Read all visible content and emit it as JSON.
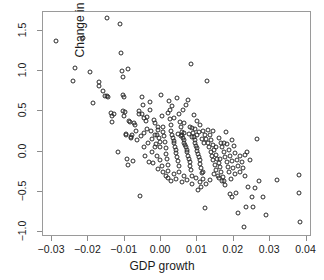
{
  "chart_data": {
    "type": "scatter",
    "title": "",
    "xlabel": "GDP growth",
    "ylabel": "Change in rate",
    "xlim": [
      -0.0325,
      0.0415
    ],
    "ylim": [
      -1.06,
      1.73
    ],
    "xticks": [
      -0.03,
      -0.02,
      -0.01,
      0.0,
      0.01,
      0.02,
      0.03,
      0.04
    ],
    "xticklabels": [
      "-0.03",
      "-0.02",
      "-0.01",
      "0.00",
      "0.01",
      "0.02",
      "0.03",
      "0.04"
    ],
    "yticks": [
      1.5,
      1.0,
      0.5,
      0.0,
      -0.5,
      -1.0
    ],
    "yticklabels": [
      "1.5",
      "1.0",
      "0.5",
      "0.0",
      "-0.5",
      "-1.0"
    ],
    "grid": false,
    "legend": null,
    "marker": "open-circle",
    "marker_color": "#2a2a2a",
    "frame_color": "#9a9a9a",
    "background": "#ffffff",
    "points": [
      [
        -0.029,
        1.37
      ],
      [
        -0.0243,
        0.88
      ],
      [
        -0.0237,
        1.04
      ],
      [
        -0.0216,
        1.41
      ],
      [
        -0.0197,
        0.98
      ],
      [
        -0.0188,
        0.6
      ],
      [
        -0.017,
        0.86
      ],
      [
        -0.017,
        0.81
      ],
      [
        -0.016,
        0.75
      ],
      [
        -0.0155,
        0.69
      ],
      [
        -0.015,
        0.69
      ],
      [
        -0.0148,
        1.66
      ],
      [
        -0.0146,
        0.68
      ],
      [
        -0.0138,
        0.48
      ],
      [
        -0.0136,
        0.44
      ],
      [
        -0.0134,
        0.37
      ],
      [
        -0.013,
        0.46
      ],
      [
        -0.0118,
        0.0
      ],
      [
        -0.0112,
        1.58
      ],
      [
        -0.011,
        1.22
      ],
      [
        -0.0108,
        1.0
      ],
      [
        -0.0106,
        0.93
      ],
      [
        -0.0104,
        0.5
      ],
      [
        -0.0102,
        0.44
      ],
      [
        -0.01,
        0.49
      ],
      [
        -0.0098,
        0.22
      ],
      [
        -0.0096,
        0.21
      ],
      [
        -0.0094,
        -0.09
      ],
      [
        -0.0092,
        -0.17
      ],
      [
        -0.009,
        1.02
      ],
      [
        -0.0088,
        0.38
      ],
      [
        -0.0086,
        0.36
      ],
      [
        -0.0084,
        0.18
      ],
      [
        -0.0082,
        0.17
      ],
      [
        -0.008,
        0.2
      ],
      [
        -0.0078,
        -0.12
      ],
      [
        -0.0074,
        0.35
      ],
      [
        -0.0072,
        0.33
      ],
      [
        -0.007,
        0.25
      ],
      [
        -0.0066,
        0.14
      ],
      [
        -0.0062,
        0.46
      ],
      [
        -0.0058,
        -0.55
      ],
      [
        -0.0056,
        0.19
      ],
      [
        -0.0052,
        0.68
      ],
      [
        -0.005,
        0.58
      ],
      [
        -0.0048,
        0.23
      ],
      [
        -0.0046,
        0.05
      ],
      [
        -0.0044,
        -0.05
      ],
      [
        -0.004,
        0.43
      ],
      [
        -0.0038,
        0.28
      ],
      [
        -0.0036,
        0.1
      ],
      [
        -0.0034,
        -0.13
      ],
      [
        -0.0032,
        0.61
      ],
      [
        -0.003,
        0.52
      ],
      [
        -0.0028,
        0.26
      ],
      [
        -0.0026,
        0.16
      ],
      [
        -0.0024,
        0.0
      ],
      [
        -0.0022,
        -0.14
      ],
      [
        -0.002,
        0.39
      ],
      [
        -0.0018,
        0.35
      ],
      [
        -0.0016,
        0.21
      ],
      [
        -0.0014,
        0.09
      ],
      [
        -0.0012,
        -0.06
      ],
      [
        -0.001,
        -0.22
      ],
      [
        -0.0008,
        0.27
      ],
      [
        -0.0006,
        0.17
      ],
      [
        -0.0004,
        0.05
      ],
      [
        -0.0002,
        -0.11
      ],
      [
        0.0,
        0.7
      ],
      [
        0.0002,
        0.44
      ],
      [
        0.0004,
        0.31
      ],
      [
        0.0006,
        0.24
      ],
      [
        0.0008,
        0.19
      ],
      [
        0.001,
        0.12
      ],
      [
        0.0012,
        0.04
      ],
      [
        0.0014,
        -0.03
      ],
      [
        0.0016,
        -0.09
      ],
      [
        0.0018,
        -0.17
      ],
      [
        0.002,
        -0.24
      ],
      [
        0.0022,
        0.63
      ],
      [
        0.0024,
        0.4
      ],
      [
        0.0026,
        0.33
      ],
      [
        0.0028,
        0.25
      ],
      [
        0.003,
        0.21
      ],
      [
        0.0032,
        0.17
      ],
      [
        0.0034,
        0.13
      ],
      [
        0.0036,
        0.1
      ],
      [
        0.0038,
        0.06
      ],
      [
        0.004,
        0.02
      ],
      [
        0.0042,
        -0.02
      ],
      [
        0.0044,
        -0.07
      ],
      [
        0.0046,
        -0.12
      ],
      [
        0.0048,
        -0.18
      ],
      [
        0.005,
        -0.26
      ],
      [
        0.0052,
        0.36
      ],
      [
        0.0054,
        0.3
      ],
      [
        0.0056,
        0.24
      ],
      [
        0.0058,
        0.2
      ],
      [
        0.006,
        0.17
      ],
      [
        0.0062,
        0.14
      ],
      [
        0.0064,
        0.11
      ],
      [
        0.0066,
        0.08
      ],
      [
        0.0068,
        0.05
      ],
      [
        0.007,
        0.02
      ],
      [
        0.0072,
        -0.01
      ],
      [
        0.0074,
        -0.05
      ],
      [
        0.0076,
        -0.09
      ],
      [
        0.0078,
        -0.13
      ],
      [
        0.008,
        -0.18
      ],
      [
        0.0082,
        -0.23
      ],
      [
        0.0084,
        -0.3
      ],
      [
        0.0086,
        0.29
      ],
      [
        0.0088,
        0.23
      ],
      [
        0.009,
        0.18
      ],
      [
        0.0092,
        0.14
      ],
      [
        0.0094,
        0.11
      ],
      [
        0.0096,
        0.07
      ],
      [
        0.0098,
        0.04
      ],
      [
        0.01,
        0.01
      ],
      [
        0.0102,
        -0.03
      ],
      [
        0.0104,
        -0.07
      ],
      [
        0.0106,
        -0.11
      ],
      [
        0.0108,
        -0.16
      ],
      [
        0.011,
        -0.21
      ],
      [
        0.0112,
        -0.27
      ],
      [
        0.0114,
        -0.34
      ],
      [
        0.003,
        0.56
      ],
      [
        0.0044,
        0.66
      ],
      [
        0.006,
        0.52
      ],
      [
        0.0068,
        0.58
      ],
      [
        0.0074,
        0.64
      ],
      [
        0.0082,
        1.09
      ],
      [
        0.009,
        0.45
      ],
      [
        0.01,
        0.38
      ],
      [
        0.0108,
        0.33
      ],
      [
        0.0116,
        0.26
      ],
      [
        0.012,
        0.21
      ],
      [
        0.0124,
        0.15
      ],
      [
        0.0128,
        0.1
      ],
      [
        0.0132,
        0.05
      ],
      [
        0.0136,
        0.0
      ],
      [
        0.014,
        -0.05
      ],
      [
        0.0144,
        -0.11
      ],
      [
        0.0148,
        -0.17
      ],
      [
        0.0152,
        -0.23
      ],
      [
        0.0156,
        -0.3
      ],
      [
        0.012,
        -0.7
      ],
      [
        0.0126,
        0.87
      ],
      [
        0.013,
        0.27
      ],
      [
        0.0134,
        0.21
      ],
      [
        0.0138,
        0.14
      ],
      [
        0.0142,
        0.08
      ],
      [
        0.0146,
        0.02
      ],
      [
        0.015,
        -0.04
      ],
      [
        0.0154,
        -0.09
      ],
      [
        0.0158,
        -0.14
      ],
      [
        0.0162,
        -0.19
      ],
      [
        0.0166,
        -0.25
      ],
      [
        0.017,
        -0.31
      ],
      [
        0.0174,
        -0.37
      ],
      [
        0.016,
        0.17
      ],
      [
        0.0164,
        0.11
      ],
      [
        0.0168,
        0.05
      ],
      [
        0.0172,
        -0.01
      ],
      [
        0.0176,
        -0.07
      ],
      [
        0.018,
        -0.13
      ],
      [
        0.0184,
        -0.19
      ],
      [
        0.0188,
        -0.25
      ],
      [
        0.0192,
        -0.34
      ],
      [
        0.0178,
        0.24
      ],
      [
        0.0182,
        0.09
      ],
      [
        0.0186,
        0.02
      ],
      [
        0.019,
        -0.05
      ],
      [
        0.0194,
        -0.12
      ],
      [
        0.0198,
        -0.2
      ],
      [
        0.0202,
        -0.28
      ],
      [
        0.0196,
        0.14
      ],
      [
        0.02,
        0.07
      ],
      [
        0.0204,
        -0.02
      ],
      [
        0.0208,
        -0.1
      ],
      [
        0.0212,
        -0.18
      ],
      [
        0.0216,
        -0.26
      ],
      [
        0.019,
        -0.53
      ],
      [
        0.0196,
        -0.57
      ],
      [
        0.0206,
        -0.52
      ],
      [
        0.0212,
        -0.76
      ],
      [
        0.0218,
        -0.05
      ],
      [
        0.0222,
        -0.13
      ],
      [
        0.0226,
        -0.21
      ],
      [
        0.023,
        -0.3
      ],
      [
        0.0228,
        -0.93
      ],
      [
        0.0234,
        -0.69
      ],
      [
        0.0238,
        -0.44
      ],
      [
        0.0232,
        -0.04
      ],
      [
        0.0236,
        0.0
      ],
      [
        0.0244,
        -0.11
      ],
      [
        0.025,
        -0.56
      ],
      [
        0.0252,
        -0.69
      ],
      [
        0.0258,
        -0.45
      ],
      [
        0.0264,
        0.15
      ],
      [
        0.027,
        -0.36
      ],
      [
        0.028,
        -0.56
      ],
      [
        0.0288,
        -0.79
      ],
      [
        0.0318,
        -0.35
      ],
      [
        0.0378,
        -0.29
      ],
      [
        0.038,
        -0.51
      ],
      [
        0.0382,
        -0.88
      ],
      [
        -0.0106,
        0.7
      ],
      [
        -0.0102,
        0.67
      ],
      [
        -0.006,
        0.5
      ],
      [
        -0.0054,
        0.47
      ],
      [
        -0.0046,
        0.41
      ],
      [
        -0.0042,
        0.38
      ],
      [
        0.0018,
        0.48
      ],
      [
        0.0024,
        0.52
      ],
      [
        0.0036,
        0.42
      ],
      [
        0.005,
        0.47
      ],
      [
        0.0064,
        0.35
      ],
      [
        0.0078,
        0.3
      ],
      [
        0.0092,
        0.28
      ],
      [
        0.0104,
        0.24
      ],
      [
        0.0012,
        -0.3
      ],
      [
        0.002,
        -0.33
      ],
      [
        0.0028,
        -0.36
      ],
      [
        0.0034,
        -0.28
      ],
      [
        0.0042,
        -0.34
      ],
      [
        0.0056,
        -0.38
      ],
      [
        0.0064,
        -0.3
      ],
      [
        0.007,
        -0.35
      ],
      [
        0.0086,
        -0.4
      ],
      [
        0.0096,
        -0.33
      ],
      [
        0.0106,
        -0.38
      ],
      [
        0.0114,
        -0.26
      ],
      [
        0.0002,
        -0.18
      ],
      [
        0.0006,
        -0.25
      ],
      [
        -0.0004,
        0.12
      ],
      [
        -0.0008,
        0.3
      ],
      [
        -0.0012,
        0.2
      ],
      [
        -0.0016,
        0.06
      ],
      [
        0.0046,
        0.22
      ],
      [
        0.0054,
        0.19
      ],
      [
        0.0062,
        0.23
      ],
      [
        0.0076,
        0.22
      ],
      [
        0.0084,
        0.18
      ],
      [
        0.0098,
        0.2
      ],
      [
        0.0112,
        0.16
      ],
      [
        0.0118,
        0.1
      ],
      [
        0.0142,
        0.26
      ],
      [
        0.0152,
        0.05
      ],
      [
        0.0162,
        -0.09
      ],
      [
        0.0172,
        0.1
      ],
      [
        0.0146,
        -0.28
      ],
      [
        0.0158,
        -0.33
      ],
      [
        0.0168,
        -0.36
      ],
      [
        0.0176,
        -0.41
      ],
      [
        0.011,
        -0.44
      ],
      [
        0.0102,
        -0.48
      ],
      [
        0.0124,
        -0.4
      ],
      [
        0.0134,
        -0.35
      ]
    ]
  }
}
